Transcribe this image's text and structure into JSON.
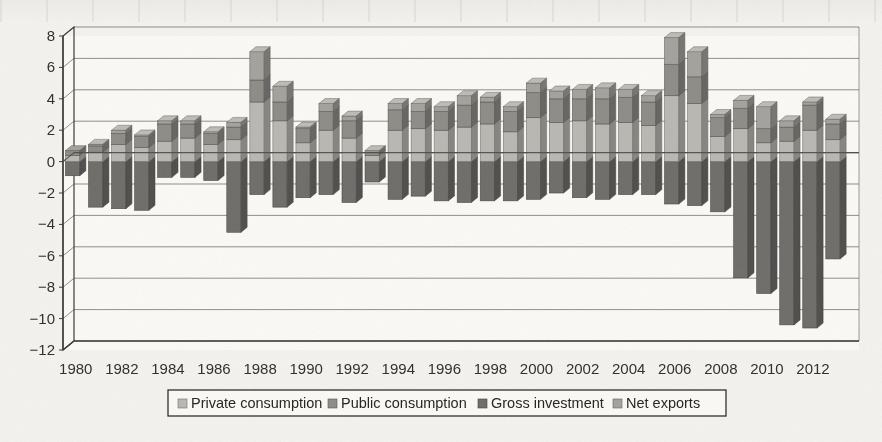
{
  "figure": {
    "kind": "scanned-figure",
    "background_color": "#f4f3ef",
    "axis_color": "#3a3835",
    "grid_color": "#6e6c68"
  },
  "legend": {
    "position": "bottom",
    "border_color": "#2d2b29",
    "items": [
      {
        "label": "Private consumption",
        "color": "#b9b7b2"
      },
      {
        "label": "Public consumption",
        "color": "#8d8b86"
      },
      {
        "label": "Gross investment",
        "color": "#6e6c68"
      },
      {
        "label": "Net exports",
        "color": "#a3a19c"
      }
    ]
  },
  "chart_data": {
    "type": "bar",
    "subtype": "stacked-column-diverging-3d",
    "title": "",
    "subtitle": "",
    "xlabel": "",
    "ylabel": "",
    "grid": true,
    "ylim": [
      -12,
      8
    ],
    "yticks": [
      8,
      6,
      4,
      2,
      0,
      -2,
      -4,
      -6,
      -8,
      -10,
      -12
    ],
    "ytick_labels": [
      "8",
      "6",
      "4",
      "2",
      "0",
      "−2",
      "−4",
      "−6",
      "−8",
      "−10",
      "−12"
    ],
    "xtick_labels": [
      "1980",
      "1982",
      "1984",
      "1986",
      "1988",
      "1990",
      "1992",
      "1994",
      "1996",
      "1998",
      "2000",
      "2002",
      "2004",
      "2006",
      "2008",
      "2010",
      "2012"
    ],
    "categories": [
      "1980",
      "1981",
      "1982",
      "1983",
      "1984",
      "1985",
      "1986",
      "1987",
      "1988",
      "1989",
      "1990",
      "1991",
      "1992",
      "1993",
      "1994",
      "1995",
      "1996",
      "1997",
      "1998",
      "1999",
      "2000",
      "2001",
      "2002",
      "2003",
      "2004",
      "2005",
      "2006",
      "2007",
      "2008",
      "2009",
      "2010",
      "2011",
      "2012",
      "2013"
    ],
    "series": [
      {
        "name": "Private consumption",
        "color": "#b9b7b2",
        "values": [
          0.4,
          0.6,
          1.1,
          0.9,
          1.3,
          1.5,
          1.1,
          1.4,
          3.8,
          2.6,
          1.2,
          2.0,
          1.5,
          0.4,
          2.0,
          2.1,
          2.0,
          2.2,
          2.4,
          1.9,
          2.8,
          2.5,
          2.6,
          2.4,
          2.5,
          2.3,
          4.2,
          3.7,
          1.6,
          2.1,
          1.2,
          1.3,
          2.0,
          1.4
        ]
      },
      {
        "name": "Public consumption",
        "color": "#8d8b86",
        "values": [
          0.3,
          0.4,
          0.7,
          0.7,
          1.1,
          0.9,
          0.7,
          0.8,
          1.4,
          1.2,
          0.9,
          1.2,
          1.1,
          0.2,
          1.3,
          1.1,
          1.2,
          1.4,
          1.4,
          1.3,
          1.6,
          1.5,
          1.4,
          1.6,
          1.6,
          1.5,
          2.0,
          1.7,
          1.2,
          1.3,
          0.9,
          0.9,
          1.6,
          1.0
        ]
      },
      {
        "name": "Gross investment",
        "color": "#6e6c68",
        "values": [
          -0.9,
          -2.9,
          -3.0,
          -3.1,
          -1.0,
          -1.0,
          -1.2,
          -4.5,
          -2.1,
          -2.9,
          -2.3,
          -2.1,
          -2.6,
          -1.3,
          -2.4,
          -2.2,
          -2.5,
          -2.6,
          -2.5,
          -2.5,
          -2.4,
          -2.0,
          -2.3,
          -2.4,
          -2.1,
          -2.1,
          -2.7,
          -2.8,
          -3.2,
          -7.4,
          -8.4,
          -10.4,
          -10.6,
          -6.2
        ]
      },
      {
        "name": "Net exports",
        "color": "#a3a19c",
        "values": [
          0.0,
          0.1,
          0.2,
          0.1,
          0.2,
          0.2,
          0.1,
          0.3,
          1.8,
          1.0,
          0.1,
          0.5,
          0.3,
          0.1,
          0.4,
          0.5,
          0.3,
          0.6,
          0.3,
          0.3,
          0.6,
          0.5,
          0.6,
          0.7,
          0.5,
          0.4,
          1.7,
          1.6,
          0.2,
          0.5,
          1.4,
          0.4,
          0.2,
          0.3
        ]
      }
    ]
  }
}
